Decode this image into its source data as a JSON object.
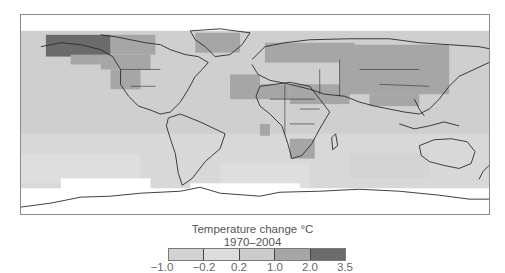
{
  "figure": {
    "type": "choropleth-world-map",
    "colors": {
      "background_ocean": "#cfcfcf",
      "no_data": "#ffffff",
      "coastline": "#2a2a2a",
      "frame": "#8a8a8a"
    }
  },
  "legend": {
    "title": "Temperature change °C",
    "period": "1970–2004",
    "bins": [
      {
        "from": -1.0,
        "to": -0.2,
        "color": "#d2d2d2"
      },
      {
        "from": -0.2,
        "to": 0.2,
        "color": "#dcdcdc"
      },
      {
        "from": 0.2,
        "to": 1.0,
        "color": "#cbcbcb"
      },
      {
        "from": 1.0,
        "to": 2.0,
        "color": "#a6a6a6"
      },
      {
        "from": 2.0,
        "to": 3.5,
        "color": "#6b6b6b"
      }
    ],
    "ticks": [
      "−1.0",
      "−0.2",
      "0.2",
      "1.0",
      "2.0",
      "3.5"
    ]
  },
  "regions": [
    {
      "name": "Alaska / NW Canada",
      "bin": "2.0–3.5"
    },
    {
      "name": "Western North America",
      "bin": "1.0–2.0"
    },
    {
      "name": "Greenland",
      "bin": "1.0–2.0"
    },
    {
      "name": "Europe",
      "bin": "1.0–2.0"
    },
    {
      "name": "Northern Asia / Siberia",
      "bin": "1.0–2.0"
    },
    {
      "name": "Central Asia / Mongolia / China",
      "bin": "1.0–2.0"
    },
    {
      "name": "Southern Africa",
      "bin": "1.0–2.0"
    },
    {
      "name": "Tropical oceans",
      "bin": "0.2–1.0"
    },
    {
      "name": "Southern oceans",
      "bin": "-0.2–0.2"
    },
    {
      "name": "Antarctica / high latitudes",
      "bin": "no data"
    }
  ]
}
